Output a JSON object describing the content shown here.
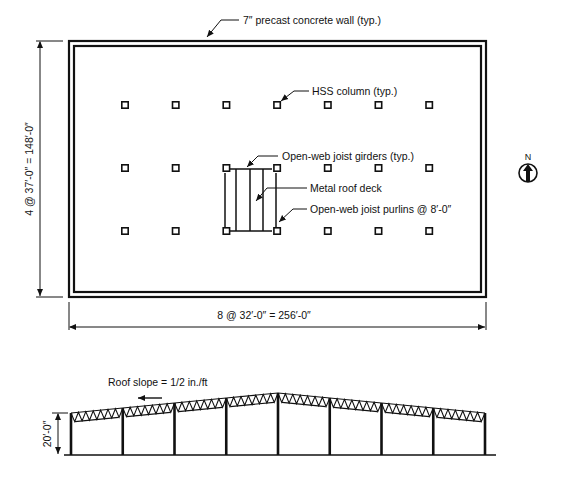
{
  "plan": {
    "wall_label": "7″ precast concrete wall (typ.)",
    "column_label": "HSS column (typ.)",
    "girder_label": "Open-web joist girders (typ.)",
    "deck_label": "Metal roof deck",
    "purlin_label": "Open-web joist purlins @ 8′-0″",
    "dim_vertical": "4 @ 37′-0″ = 148′-0″",
    "dim_horizontal": "8 @ 32′-0″ = 256′-0″",
    "bays_x": 8,
    "bays_y": 4,
    "interior_columns_per_row": 7,
    "interior_column_rows": 3,
    "north_label": "N",
    "north_icon": "north-arrow-icon"
  },
  "elevation": {
    "slope_label": "Roof slope = 1/2 in./ft",
    "height_dim": "20′-0″",
    "bays": 8
  }
}
